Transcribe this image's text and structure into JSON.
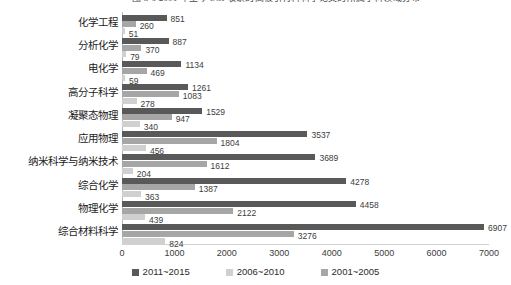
{
  "caption": {
    "text": "图 3-6  2001 年至今 SCI 收录的高被引材料科学论文的所属学科领域分布"
  },
  "chart_data": {
    "type": "bar",
    "orientation": "horizontal",
    "title": "",
    "xlabel": "",
    "ylabel": "",
    "xlim": [
      0,
      7000
    ],
    "xticks": [
      0,
      1000,
      2000,
      3000,
      4000,
      5000,
      6000,
      7000
    ],
    "grid": false,
    "legend_position": "bottom",
    "categories": [
      "化学工程",
      "分析化学",
      "电化学",
      "高分子科学",
      "凝聚态物理",
      "应用物理",
      "纳米科学与纳米技术",
      "综合化学",
      "物理化学",
      "综合材料科学"
    ],
    "series": [
      {
        "name": "2011~2015",
        "color": "#595959",
        "values": [
          851,
          887,
          1134,
          1261,
          1529,
          3537,
          3689,
          4278,
          4458,
          6907
        ]
      },
      {
        "name": "2006~2010",
        "color": "#d0d0d0",
        "values": [
          51,
          79,
          59,
          278,
          340,
          456,
          204,
          363,
          439,
          824
        ]
      },
      {
        "name": "2001~2005",
        "color": "#a6a6a6",
        "values": [
          260,
          370,
          469,
          1083,
          947,
          1804,
          1612,
          1387,
          2122,
          3276
        ]
      }
    ],
    "bar_order_top_to_bottom": [
      "2011~2015",
      "2001~2005",
      "2006~2010"
    ]
  },
  "legend": {
    "items": [
      {
        "label": "2011~2015",
        "color": "#595959"
      },
      {
        "label": "2006~2010",
        "color": "#d0d0d0"
      },
      {
        "label": "2001~2005",
        "color": "#a6a6a6"
      }
    ]
  }
}
